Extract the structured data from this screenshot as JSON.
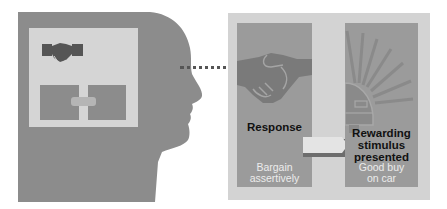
{
  "diagram": {
    "head": {
      "icon": "person-head-profile-icon",
      "inner_panel": {
        "icon": "handshake-icon",
        "boxes": [
          "response-box-mini",
          "reward-box-mini"
        ],
        "connector": "connector-bar"
      }
    },
    "link": "dotted-line",
    "panel": {
      "response": {
        "icon": "handshake-icon",
        "title": "Response",
        "subtitle_line1": "Bargain",
        "subtitle_line2": "assertively"
      },
      "arrow": "arrow-right-icon",
      "reward": {
        "icon": "car-sunburst-icon",
        "title_line1": "Rewarding",
        "title_line2": "stimulus",
        "title_line3": "presented",
        "subtitle_line1": "Good buy",
        "subtitle_line2": "on car"
      }
    },
    "colors": {
      "head": "#8c8c8c",
      "panel_bg": "#d3d3d3",
      "column": "#9b9b9b",
      "icon_dark": "#555555",
      "icon_mid": "#7a7a7a"
    }
  }
}
